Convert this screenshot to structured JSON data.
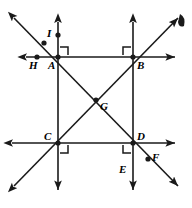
{
  "figure": {
    "type": "geometry-diagram",
    "stroke_color": "#1a1a1a",
    "background_color": "#ffffff",
    "points": [
      {
        "id": "A",
        "label": "A",
        "x": 58,
        "y": 57,
        "label_x": 48,
        "label_y": 60,
        "dot": true
      },
      {
        "id": "B",
        "label": "B",
        "x": 133,
        "y": 57,
        "label_x": 137,
        "label_y": 60,
        "dot": true
      },
      {
        "id": "C",
        "label": "C",
        "x": 58,
        "y": 143,
        "label_x": 44,
        "label_y": 131,
        "dot": true
      },
      {
        "id": "D",
        "label": "D",
        "x": 133,
        "y": 143,
        "label_x": 137,
        "label_y": 131,
        "dot": true
      },
      {
        "id": "G",
        "label": "G",
        "x": 96,
        "y": 100,
        "label_x": 100,
        "label_y": 101,
        "dot": true
      },
      {
        "id": "H",
        "label": "H",
        "x": 37,
        "y": 57,
        "label_x": 29,
        "label_y": 60,
        "dot": true
      },
      {
        "id": "I",
        "label": "I",
        "x": 44,
        "y": 43,
        "label_x": 47,
        "label_y": 28,
        "dot": true
      },
      {
        "id": "E",
        "label": "E",
        "x": 133,
        "y": 178,
        "label_x": 119,
        "label_y": 164,
        "dot": false
      },
      {
        "id": "F",
        "label": "F",
        "x": 148,
        "y": 159,
        "label_x": 152,
        "label_y": 152,
        "dot": true
      },
      {
        "id": "J",
        "label": "",
        "x": 58,
        "y": 35,
        "label_x": 0,
        "label_y": 0,
        "dot": true
      }
    ],
    "lines": [
      {
        "name": "horizontal-line-top",
        "x1": 26,
        "y1": 57,
        "x2": 175,
        "y2": 57,
        "arrow_start": true,
        "arrow_end": true
      },
      {
        "name": "horizontal-line-bottom",
        "x1": 12,
        "y1": 143,
        "x2": 175,
        "y2": 143,
        "arrow_start": true,
        "arrow_end": true
      },
      {
        "name": "vertical-line-left",
        "x1": 58,
        "y1": 22,
        "x2": 58,
        "y2": 190,
        "arrow_start": true,
        "arrow_end": true
      },
      {
        "name": "vertical-line-right",
        "x1": 133,
        "y1": 22,
        "x2": 133,
        "y2": 190,
        "arrow_start": true,
        "arrow_end": true
      },
      {
        "name": "diagonal-line-falling",
        "x1": 14,
        "y1": 18,
        "x2": 178,
        "y2": 186,
        "arrow_start": true,
        "arrow_end": true
      },
      {
        "name": "diagonal-line-rising",
        "x1": 14,
        "y1": 186,
        "x2": 178,
        "y2": 18,
        "arrow_start": true,
        "arrow_end": true
      }
    ],
    "right_angle_marks": [
      {
        "name": "right-angle-mark-A",
        "corner_x": 58,
        "corner_y": 57,
        "dx": 1,
        "dy": -1
      },
      {
        "name": "right-angle-mark-B",
        "corner_x": 133,
        "corner_y": 57,
        "dx": -1,
        "dy": -1
      },
      {
        "name": "right-angle-mark-C",
        "corner_x": 58,
        "corner_y": 143,
        "dx": 1,
        "dy": 1
      },
      {
        "name": "right-angle-mark-D",
        "corner_x": 133,
        "corner_y": 143,
        "dx": -1,
        "dy": 1
      }
    ],
    "corner_fragment": {
      "name": "edge-fragment-top-right",
      "x": 180,
      "y": 14,
      "visible": true
    }
  }
}
